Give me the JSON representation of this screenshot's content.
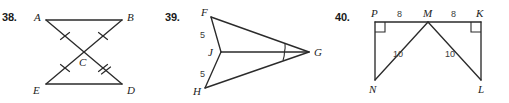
{
  "page": {
    "kind": "geometry-exercise-figures",
    "background_color": "#ffffff",
    "ink_color": "#2b2b2b"
  },
  "figures": [
    {
      "number": "38.",
      "name": "bowtie-triangles-ABC-DEC",
      "vertices": [
        {
          "label": "A",
          "x": 38,
          "y": 16
        },
        {
          "label": "B",
          "x": 128,
          "y": 16
        },
        {
          "label": "C",
          "x": 84,
          "y": 62
        },
        {
          "label": "E",
          "x": 38,
          "y": 88
        },
        {
          "label": "D",
          "x": 128,
          "y": 88
        }
      ],
      "segments": [
        "AB",
        "AD",
        "BE",
        "ED"
      ],
      "tick_marks": [
        {
          "segment": "AC",
          "count": 1
        },
        {
          "segment": "BC",
          "count": 1
        },
        {
          "segment": "EC",
          "count": 1
        },
        {
          "segment": "CD",
          "count": 2
        }
      ],
      "length_labels": []
    },
    {
      "number": "39.",
      "name": "dart-kite-FJHG",
      "vertices": [
        {
          "label": "F",
          "x": 48,
          "y": 14
        },
        {
          "label": "J",
          "x": 58,
          "y": 52
        },
        {
          "label": "H",
          "x": 42,
          "y": 90
        },
        {
          "label": "G",
          "x": 146,
          "y": 52
        }
      ],
      "segments": [
        "FJ",
        "JH",
        "FG",
        "HG",
        "JG"
      ],
      "length_labels": [
        {
          "segment": "FJ",
          "value": "5",
          "x": 41,
          "y": 34
        },
        {
          "segment": "JH",
          "value": "5",
          "x": 41,
          "y": 74
        }
      ],
      "angle_arcs": [
        {
          "angle": "FGJ",
          "count": 1
        },
        {
          "angle": "JGH",
          "count": 1
        }
      ]
    },
    {
      "number": "40.",
      "name": "double-right-triangles-PMN-KML",
      "vertices": [
        {
          "label": "P",
          "x": 42,
          "y": 16
        },
        {
          "label": "M",
          "x": 93,
          "y": 16
        },
        {
          "label": "K",
          "x": 145,
          "y": 16
        },
        {
          "label": "N",
          "x": 42,
          "y": 78
        },
        {
          "label": "L",
          "x": 145,
          "y": 78
        }
      ],
      "segments": [
        "PK",
        "PN",
        "KL",
        "MN",
        "ML"
      ],
      "right_angles": [
        {
          "vertex": "P",
          "between": [
            "PK",
            "PN"
          ]
        },
        {
          "vertex": "K",
          "between": [
            "PK",
            "KL"
          ]
        }
      ],
      "length_labels": [
        {
          "segment": "PM",
          "value": "8",
          "x": 67,
          "y": 14
        },
        {
          "segment": "MK",
          "value": "8",
          "x": 119,
          "y": 14
        },
        {
          "segment": "MN",
          "value": "10",
          "x": 64,
          "y": 52
        },
        {
          "segment": "ML",
          "value": "10",
          "x": 116,
          "y": 52
        }
      ]
    }
  ]
}
